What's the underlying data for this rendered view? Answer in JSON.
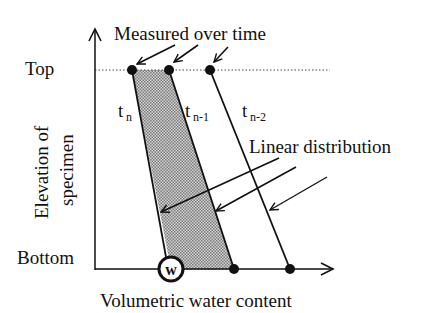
{
  "diagram": {
    "title_annotation": "Measured over time",
    "y_axis": {
      "label_line1": "Elevation of",
      "label_line2": "specimen",
      "top_label": "Top",
      "bottom_label": "Bottom"
    },
    "x_axis": {
      "label": "Volumetric water content"
    },
    "profiles": [
      {
        "name": "t",
        "subscript": "n"
      },
      {
        "name": "t",
        "subscript": "n-1"
      },
      {
        "name": "t",
        "subscript": "n-2"
      }
    ],
    "linear_annotation": "Linear distribution",
    "bottom_marker": "w",
    "colors": {
      "ink": "#111111",
      "shade": "#b8b8b8"
    }
  }
}
